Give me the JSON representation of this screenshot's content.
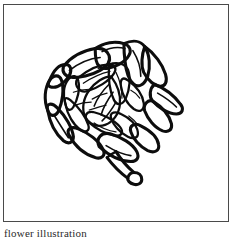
{
  "page": {
    "background_color": "#ffffff",
    "width": 235,
    "height": 237
  },
  "figure": {
    "frame": {
      "border_color": "#4a4a4a",
      "border_width_px": 1,
      "x": 3,
      "y": 4,
      "width": 226,
      "height": 218
    },
    "ink_color": "#0d0d0d",
    "style": "pen-and-ink line art",
    "parts": [
      {
        "name": "outer-bracts",
        "count": 11
      },
      {
        "name": "inner-bracts",
        "count": 7
      },
      {
        "name": "central-whorl",
        "count": 1
      },
      {
        "name": "stem",
        "count": 1
      },
      {
        "name": "stem-knob",
        "count": 1
      }
    ]
  },
  "caption": {
    "text": "flower illustration",
    "cropped": true
  }
}
